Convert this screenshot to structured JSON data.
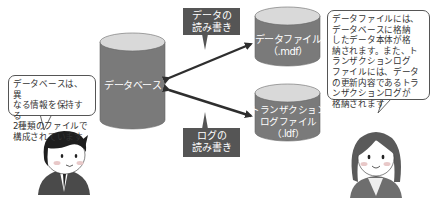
{
  "diagram": {
    "database": {
      "label": "データベース"
    },
    "data_file": {
      "label_line1": "データファイル",
      "label_line2": "（.mdf）"
    },
    "log_file": {
      "label_line1": "トランザクション",
      "label_line2": "ログファイル",
      "label_line3": "（.ldf）"
    },
    "tag_data_rw": {
      "line1": "データの",
      "line2": "読み書き"
    },
    "tag_log_rw": {
      "line1": "ログの",
      "line2": "読み書き"
    },
    "left_bubble": {
      "lines": [
        "データベースは、異",
        "なる情報を保持する",
        "2種類のファイルで",
        "構成されています"
      ]
    },
    "right_bubble": {
      "lines": [
        "データファイルには、",
        "データベースに格納",
        "したデータ本体が格",
        "納されます。また、ト",
        "ランザクションログ",
        "ファイルには、データ",
        "の更新内容であるトラ",
        "ンザクションログが",
        "格納されます"
      ]
    },
    "colors": {
      "cylinder_body": "#7a7a7a",
      "cylinder_top": "#d9d9d9",
      "tag_bg": "#555555",
      "arrow": "#2e2e2e"
    }
  }
}
